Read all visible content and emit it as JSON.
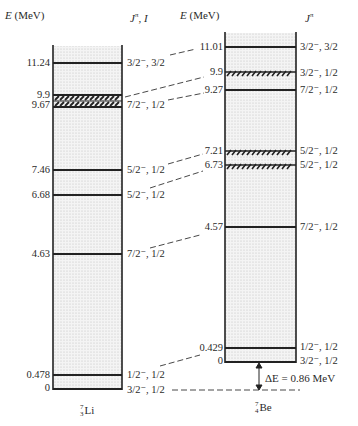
{
  "headers": {
    "li_energy": "E (MeV)",
    "li_spin": "Jπ, I",
    "be_energy": "E (MeV)",
    "be_spin": "Jπ"
  },
  "li7": {
    "nuclide": {
      "A": "7",
      "Z": "3",
      "symbol": "Li"
    },
    "levels": [
      {
        "energy": "11.24",
        "jpi": "3/2⁻, 3/2",
        "broad": false
      },
      {
        "energy": "9.9",
        "jpi": "",
        "broad": true
      },
      {
        "energy": "9.67",
        "jpi": "7/2⁻, 1/2",
        "broad": true
      },
      {
        "energy": "7.46",
        "jpi": "5/2⁻, 1/2",
        "broad": false
      },
      {
        "energy": "6.68",
        "jpi": "5/2⁻, 1/2",
        "broad": false
      },
      {
        "energy": "4.63",
        "jpi": "7/2⁻, 1/2",
        "broad": false
      },
      {
        "energy": "0.478",
        "jpi": "1/2⁻, 1/2",
        "broad": false
      },
      {
        "energy": "0",
        "jpi": "3/2⁻, 1/2",
        "broad": false
      }
    ]
  },
  "be7": {
    "nuclide": {
      "A": "7",
      "Z": "4",
      "symbol": "Be"
    },
    "levels": [
      {
        "energy": "11.01",
        "jpi": "3/2⁻, 3/2",
        "broad": false
      },
      {
        "energy": "9.9",
        "jpi": "3/2⁻, 1/2",
        "broad": true
      },
      {
        "energy": "9.27",
        "jpi": "7/2⁻, 1/2",
        "broad": false
      },
      {
        "energy": "7.21",
        "jpi": "5/2⁻, 1/2",
        "broad": true
      },
      {
        "energy": "6.73",
        "jpi": "5/2⁻, 1/2",
        "broad": true
      },
      {
        "energy": "4.57",
        "jpi": "7/2⁻, 1/2",
        "broad": false
      },
      {
        "energy": "0.429",
        "jpi": "1/2⁻, 1/2",
        "broad": false
      },
      {
        "energy": "0",
        "jpi": "3/2⁻, 1/2",
        "broad": false
      }
    ]
  },
  "delta": {
    "label": "ΔE = 0.86 MeV"
  }
}
